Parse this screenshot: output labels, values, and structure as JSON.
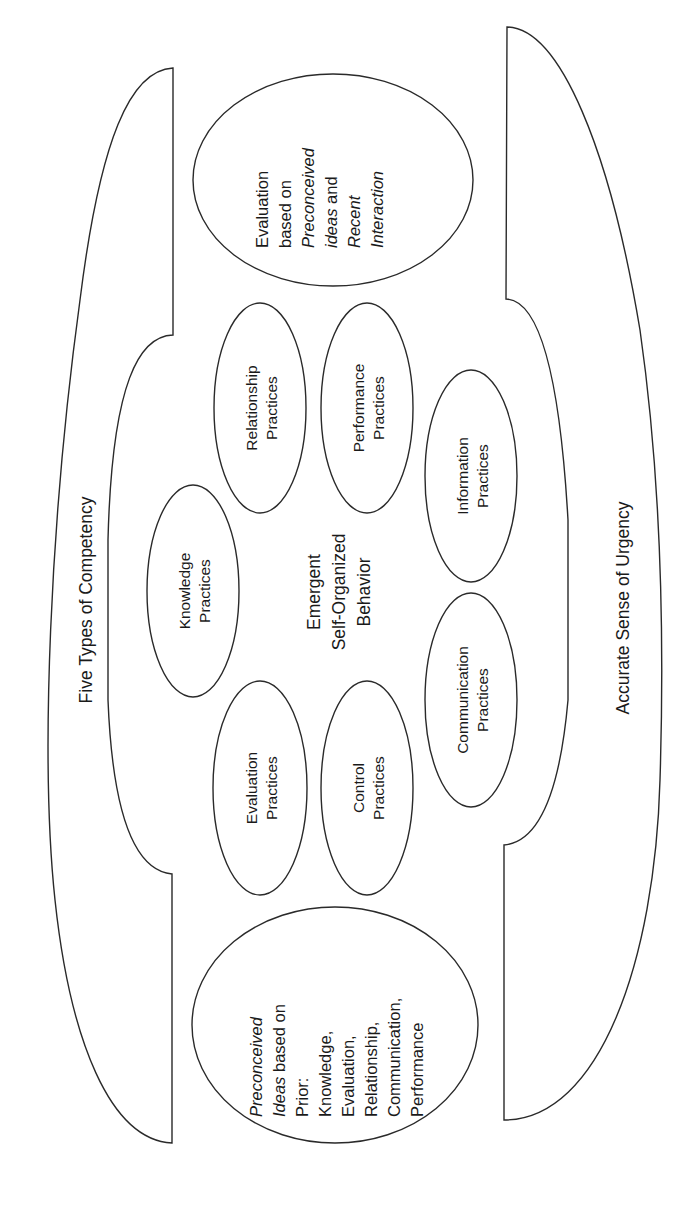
{
  "diagram": {
    "orientation": "rotated 90deg counter-clockwise",
    "outer_top_label": "Five Types of Competency",
    "outer_bottom_label": "Accurate Sense of Urgency",
    "center_label": {
      "line1": "Emergent",
      "line2": "Self-Organized",
      "line3": "Behavior"
    },
    "practices": [
      {
        "line1": "Knowledge",
        "line2": "Practices"
      },
      {
        "line1": "Relationship",
        "line2": "Practices"
      },
      {
        "line1": "Performance",
        "line2": "Practices"
      },
      {
        "line1": "Information",
        "line2": "Practices"
      },
      {
        "line1": "Communication",
        "line2": "Practices"
      },
      {
        "line1": "Control",
        "line2": "Practices"
      },
      {
        "line1": "Evaluation",
        "line2": "Practices"
      }
    ],
    "input_oval": {
      "line1_italic": "Preconceived",
      "line2_italic": "Ideas",
      "line2_rest": " based on",
      "line3": "Prior:",
      "line4": "Knowledge,",
      "line5": "Evaluation,",
      "line6": "Relationship,",
      "line7": "Communication,",
      "line8": "Performance"
    },
    "output_oval": {
      "line1": "Evaluation",
      "line2": "based on",
      "line3_italic": "Preconceived",
      "line4_italic": "ideas",
      "line4_rest": " and",
      "line5_italic": "Recent",
      "line6_italic": "Interaction"
    }
  },
  "colors": {
    "stroke": "#2a2a2a",
    "text": "#1a1a1a",
    "background": "#ffffff"
  }
}
